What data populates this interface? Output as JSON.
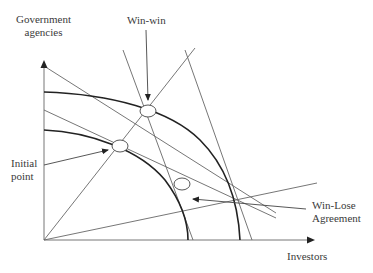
{
  "diagram": {
    "y_axis_label_line1": "Government",
    "y_axis_label_line2": "agencies",
    "x_axis_label": "Investors",
    "annotations": {
      "win_win": "Win-win",
      "initial_line1": "Initial",
      "initial_line2": "point",
      "win_lose_line1": "Win-Lose",
      "win_lose_line2": "Agreement"
    },
    "colors": {
      "line": "#555555",
      "curve": "#222222",
      "background": "#ffffff"
    }
  }
}
